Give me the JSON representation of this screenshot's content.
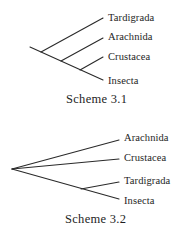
{
  "schemes": [
    {
      "caption": "Scheme 3.1",
      "taxa": [
        "Tardigrada",
        "Arachnida",
        "Crustacea",
        "Insecta"
      ]
    },
    {
      "caption": "Scheme 3.2",
      "taxa": [
        "Arachnida",
        "Crustacea",
        "Tardigrada",
        "Insecta"
      ]
    }
  ],
  "colors": {
    "line": "#2a2a2a",
    "text": "#1e1e1e",
    "background": "#ffffff"
  }
}
